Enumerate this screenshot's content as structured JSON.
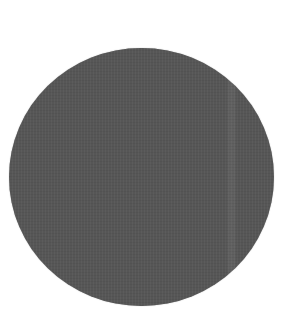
{
  "image": {
    "subject": "dark gray textured circle",
    "background_color": "#ffffff",
    "disc": {
      "color": "#565656",
      "shape": "circle",
      "texture": "fine woven fabric"
    }
  }
}
